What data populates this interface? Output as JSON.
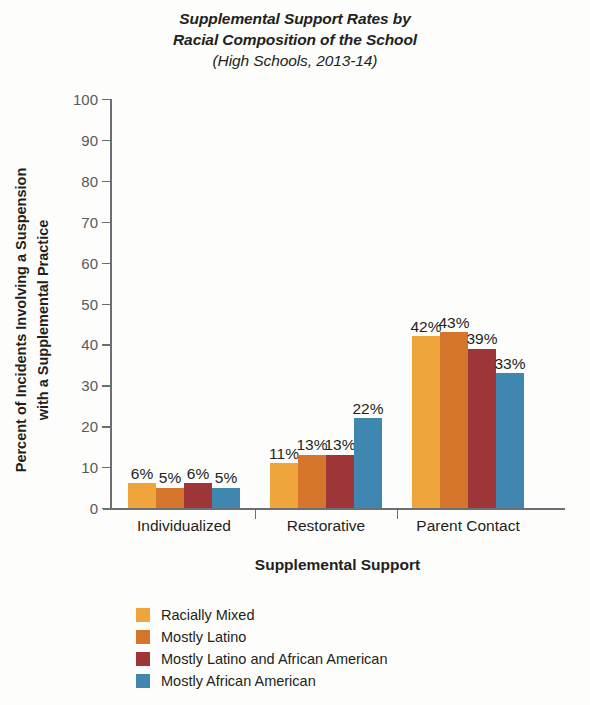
{
  "chart_data": {
    "type": "bar",
    "title": "Supplemental Support Rates by Racial Composition of the School",
    "title_line1": "Supplemental Support Rates by",
    "title_line2": "Racial Composition of the School",
    "subtitle": "(High Schools, 2013-14)",
    "xlabel": "Supplemental Support",
    "ylabel": "Percent of Incidents Involving a Suspension with a Supplemental Practice",
    "ylabel_line1": "Percent of Incidents Involving a Suspension",
    "ylabel_line2": "with a Supplemental Practice",
    "categories": [
      "Individualized",
      "Restorative",
      "Parent Contact"
    ],
    "ylim": [
      0,
      100
    ],
    "yticks": [
      0,
      10,
      20,
      30,
      40,
      50,
      60,
      70,
      80,
      90,
      100
    ],
    "ytick_labels": [
      "0",
      "10",
      "20",
      "30",
      "40",
      "50",
      "60",
      "70",
      "80",
      "90",
      "100"
    ],
    "grid": false,
    "legend_position": "bottom-left",
    "value_suffix": "%",
    "series": [
      {
        "name": "Racially Mixed",
        "color": "#EFA43C",
        "values": [
          6,
          11,
          42
        ],
        "labels": [
          "6%",
          "11%",
          "42%"
        ]
      },
      {
        "name": "Mostly Latino",
        "color": "#D5762C",
        "values": [
          5,
          13,
          43
        ],
        "labels": [
          "5%",
          "13%",
          "43%"
        ]
      },
      {
        "name": "Mostly Latino and African American",
        "color": "#9E3639",
        "values": [
          6,
          13,
          39
        ],
        "labels": [
          "6%",
          "13%",
          "39%"
        ]
      },
      {
        "name": "Mostly African American",
        "color": "#3F86B0",
        "values": [
          5,
          22,
          33
        ],
        "labels": [
          "5%",
          "22%",
          "33%"
        ]
      }
    ]
  }
}
